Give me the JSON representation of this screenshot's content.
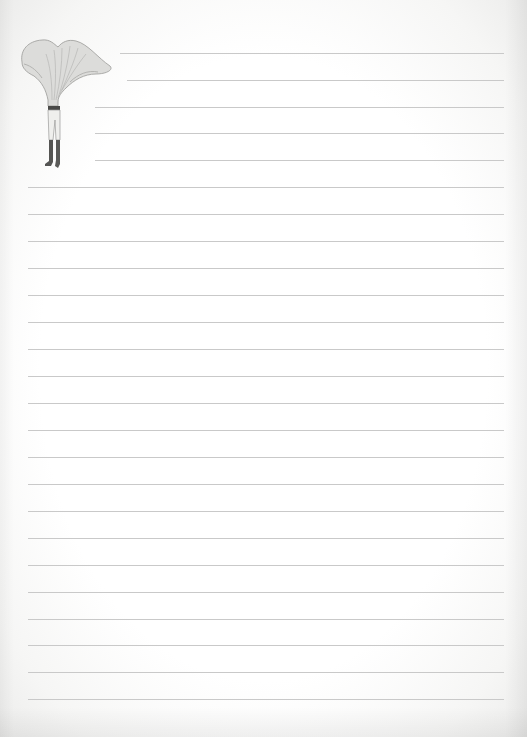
{
  "page": {
    "type": "lined-stationery",
    "background_color": "#ffffff",
    "rule_color": "#c9c9c9"
  },
  "illustration": {
    "subject": "mushroom-headed figure in trousers and boots",
    "cap_color": "#d8d8d6",
    "stem_color": "#e6e6e4",
    "trousers_color": "#efefed",
    "waistband_color": "#4a4a48",
    "boots_color": "#555553"
  },
  "short_rules": [
    {
      "y": 53,
      "x1": 120,
      "x2": 504
    },
    {
      "y": 80,
      "x1": 127,
      "x2": 504
    },
    {
      "y": 107,
      "x1": 95,
      "x2": 504
    },
    {
      "y": 133,
      "x1": 95,
      "x2": 504
    },
    {
      "y": 160,
      "x1": 95,
      "x2": 504
    }
  ],
  "full_rules": {
    "x1": 28,
    "x2": 504,
    "ys": [
      187,
      214,
      241,
      268,
      295,
      322,
      349,
      376,
      403,
      430,
      457,
      484,
      511,
      538,
      565,
      592,
      619,
      645,
      672,
      699
    ]
  }
}
